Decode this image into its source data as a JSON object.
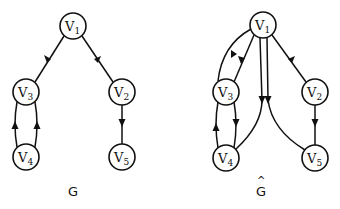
{
  "figure": {
    "background": "#ffffff",
    "stroke_color": "#111111",
    "node_radius": 13
  },
  "graphs": [
    {
      "id": "G",
      "label": "G",
      "label_hat": "",
      "label_pos": [
        73,
        193
      ],
      "nodes": [
        {
          "id": "v1",
          "base": "V",
          "sub": "1",
          "x": 73,
          "y": 26
        },
        {
          "id": "v2",
          "base": "V",
          "sub": "2",
          "x": 122,
          "y": 92
        },
        {
          "id": "v3",
          "base": "V",
          "sub": "3",
          "x": 26,
          "y": 92
        },
        {
          "id": "v4",
          "base": "V",
          "sub": "4",
          "x": 26,
          "y": 157
        },
        {
          "id": "v5",
          "base": "V",
          "sub": "5",
          "x": 122,
          "y": 157
        }
      ],
      "edges": [
        {
          "from": "v1",
          "to": "v3"
        },
        {
          "from": "v1",
          "to": "v2"
        },
        {
          "from": "v2",
          "to": "v5"
        },
        {
          "from": "v4",
          "to": "v3",
          "side": "left"
        },
        {
          "from": "v4",
          "to": "v3",
          "side": "right"
        }
      ]
    },
    {
      "id": "G_hat",
      "label": "G",
      "label_hat": "^",
      "label_pos": [
        261,
        193
      ],
      "nodes": [
        {
          "id": "v1",
          "base": "V",
          "sub": "1",
          "x": 263,
          "y": 25
        },
        {
          "id": "v2",
          "base": "V",
          "sub": "2",
          "x": 315,
          "y": 92
        },
        {
          "id": "v3",
          "base": "V",
          "sub": "3",
          "x": 226,
          "y": 92
        },
        {
          "id": "v4",
          "base": "V",
          "sub": "4",
          "x": 226,
          "y": 158
        },
        {
          "id": "v5",
          "base": "V",
          "sub": "5",
          "x": 315,
          "y": 158
        }
      ],
      "edges": [
        {
          "from": "v1",
          "to": "v3"
        },
        {
          "from": "v3",
          "to": "v1",
          "curved": true
        },
        {
          "from": "v1",
          "to": "v2"
        },
        {
          "from": "v2",
          "to": "v5"
        },
        {
          "from": "v3",
          "to": "v4"
        },
        {
          "from": "v4",
          "to": "v3"
        },
        {
          "from": "v4",
          "to": "v1",
          "curved": true
        },
        {
          "from": "v1",
          "to": "v5",
          "curved": true
        }
      ]
    }
  ]
}
